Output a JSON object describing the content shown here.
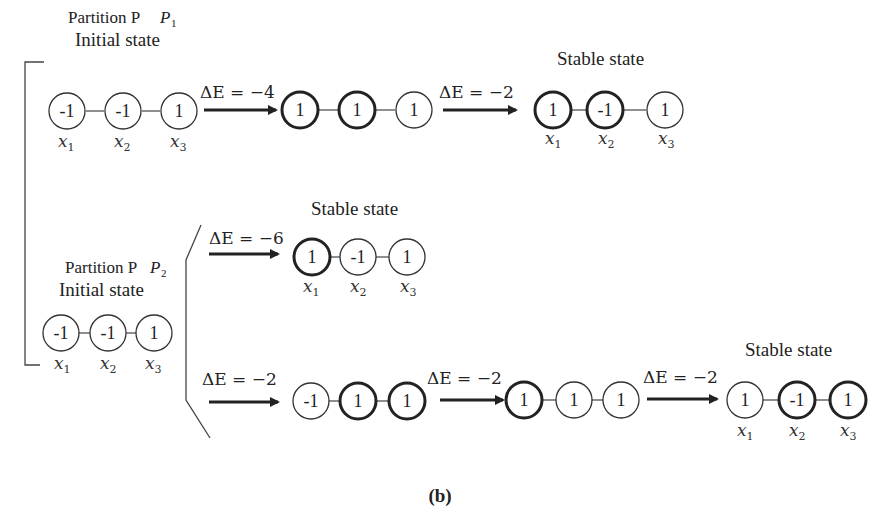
{
  "figure": {
    "caption": "(b)",
    "partitions": [
      {
        "id": "P1",
        "title": "Partition P",
        "subscript": "1",
        "initial_label": "Initial state",
        "initial_state": {
          "values": [
            "-1",
            "-1",
            "1"
          ],
          "bold": [
            false,
            false,
            false
          ],
          "vars": [
            "x1",
            "x2",
            "x3"
          ]
        },
        "paths": [
          {
            "steps": [
              {
                "delta": "ΔE = −4",
                "state": {
                  "values": [
                    "1",
                    "1",
                    "1"
                  ],
                  "bold": [
                    true,
                    true,
                    false
                  ]
                }
              },
              {
                "delta": "ΔE = −2",
                "state": {
                  "values": [
                    "1",
                    "-1",
                    "1"
                  ],
                  "bold": [
                    true,
                    true,
                    false
                  ],
                  "vars": [
                    "x1",
                    "x2",
                    "x3"
                  ]
                },
                "label": "Stable state"
              }
            ]
          }
        ]
      },
      {
        "id": "P2",
        "title": "Partition P",
        "subscript": "2",
        "initial_label": "Initial state",
        "initial_state": {
          "values": [
            "-1",
            "-1",
            "1"
          ],
          "bold": [
            false,
            false,
            false
          ],
          "vars": [
            "x1",
            "x2",
            "x3"
          ]
        },
        "paths": [
          {
            "steps": [
              {
                "delta": "ΔE = −6",
                "state": {
                  "values": [
                    "1",
                    "-1",
                    "1"
                  ],
                  "bold": [
                    true,
                    false,
                    false
                  ],
                  "vars": [
                    "x1",
                    "x2",
                    "x3"
                  ]
                },
                "label": "Stable state"
              }
            ]
          },
          {
            "steps": [
              {
                "delta": "ΔE = −2",
                "state": {
                  "values": [
                    "-1",
                    "1",
                    "1"
                  ],
                  "bold": [
                    false,
                    true,
                    true
                  ]
                }
              },
              {
                "delta": "ΔE = −2",
                "state": {
                  "values": [
                    "1",
                    "1",
                    "1"
                  ],
                  "bold": [
                    true,
                    false,
                    false
                  ]
                }
              },
              {
                "delta": "ΔE = −2",
                "state": {
                  "values": [
                    "1",
                    "-1",
                    "1"
                  ],
                  "bold": [
                    false,
                    true,
                    true
                  ],
                  "vars": [
                    "x1",
                    "x2",
                    "x3"
                  ]
                },
                "label": "Stable state"
              }
            ]
          }
        ]
      }
    ]
  },
  "labels": {
    "p1_title": "Partition P",
    "p1_sub": "1",
    "p1_initial": "Initial state",
    "p1_stable": "Stable state",
    "p2_title": "Partition P",
    "p2_sub": "2",
    "p2_initial": "Initial state",
    "p2a_stable": "Stable state",
    "p2b_stable": "Stable state",
    "caption": "(b)",
    "deltas": {
      "p1_s1": "ΔE = −4",
      "p1_s2": "ΔE = −2",
      "p2a_s1": "ΔE = −6",
      "p2b_s1": "ΔE = −2",
      "p2b_s2": "ΔE = −2",
      "p2b_s3": "ΔE = −2"
    },
    "vars": {
      "x": "x",
      "s1": "1",
      "s2": "2",
      "s3": "3"
    }
  },
  "nodes": {
    "p1_init": [
      "-1",
      "-1",
      "1"
    ],
    "p1_mid": [
      "1",
      "1",
      "1"
    ],
    "p1_stable": [
      "1",
      "-1",
      "1"
    ],
    "p2_init": [
      "-1",
      "-1",
      "1"
    ],
    "p2a_stable": [
      "1",
      "-1",
      "1"
    ],
    "p2b_mid1": [
      "-1",
      "1",
      "1"
    ],
    "p2b_mid2": [
      "1",
      "1",
      "1"
    ],
    "p2b_stable": [
      "1",
      "-1",
      "1"
    ]
  },
  "colors": {
    "ink": "#222222",
    "background": "#ffffff"
  }
}
